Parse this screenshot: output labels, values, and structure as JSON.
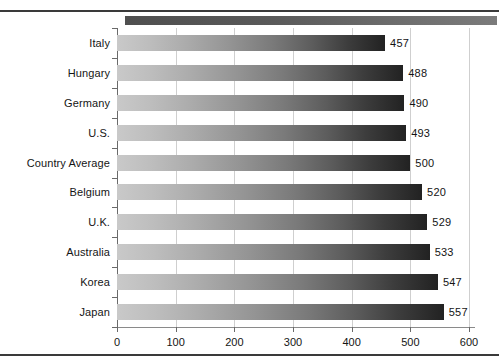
{
  "chart_data": {
    "type": "bar",
    "orientation": "horizontal",
    "title": "",
    "subtitle": "",
    "xlabel": "",
    "ylabel": "",
    "categories": [
      "Italy",
      "Hungary",
      "Germany",
      "U.S.",
      "Country Average",
      "Belgium",
      "U.K.",
      "Australia",
      "Korea",
      "Japan"
    ],
    "values": [
      457,
      488,
      490,
      493,
      500,
      520,
      529,
      533,
      547,
      557
    ],
    "value_labels": [
      "457",
      "488",
      "490",
      "493",
      "500",
      "520",
      "529",
      "533",
      "547",
      "557"
    ],
    "xlim": [
      0,
      600
    ],
    "xticks": [
      0,
      100,
      200,
      300,
      400,
      500,
      600
    ],
    "xticklabels": [
      "0",
      "100",
      "200",
      "300",
      "400",
      "500",
      "600"
    ],
    "grid": "vertical-only",
    "legend": "none",
    "bar_fill": "horizontal gradient light-gray to near-black",
    "series": [
      {
        "name": "score",
        "values": [
          457,
          488,
          490,
          493,
          500,
          520,
          529,
          533,
          547,
          557
        ]
      }
    ]
  },
  "colors": {
    "background": "#ffffff",
    "rule": "#3a3a3a",
    "gridline": "#cfcfcf",
    "axis": "#6a6a6a",
    "bar_light": "#c9c9c9",
    "bar_dark": "#222222",
    "header_bar": "#5a5a5a",
    "text": "#151515"
  },
  "decoration": {
    "header_bar_label": "header-accent-bar",
    "top_rule_label": "top-divider",
    "bottom_rule_label": "bottom-divider"
  }
}
